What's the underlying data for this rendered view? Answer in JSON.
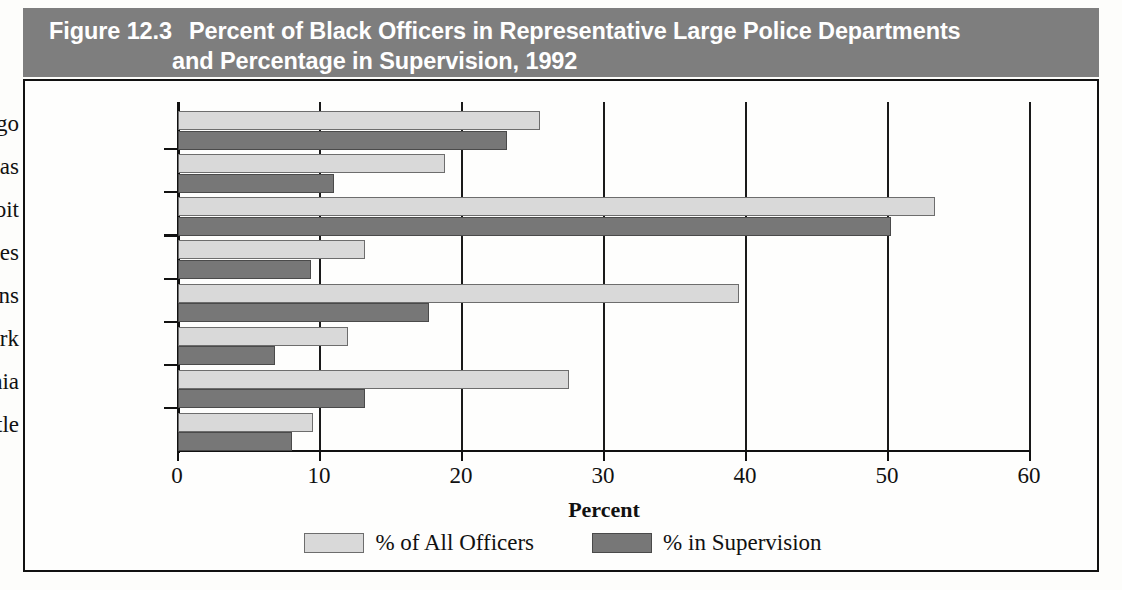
{
  "figure": {
    "number": "Figure 12.3",
    "title_line_1": "Percent of Black Officers in Representative Large Police Departments",
    "title_line_2": "and Percentage in Supervision, 1992",
    "banner_color": "#7e7e7e"
  },
  "chart_data": {
    "type": "bar",
    "orientation": "horizontal",
    "xlabel": "Percent",
    "ylabel": "",
    "xlim": [
      0,
      60
    ],
    "xticks": [
      0,
      10,
      20,
      30,
      40,
      50,
      60
    ],
    "xtick_labels": [
      "0",
      "10",
      "20",
      "30",
      "40",
      "50",
      "60"
    ],
    "grid": true,
    "legend_position": "bottom",
    "categories": [
      "Chicago",
      "Dallas",
      "Detroit",
      "Los Angeles",
      "New Orleans",
      "New York",
      "Philadelphia",
      "Seattle"
    ],
    "series": [
      {
        "name": "% of All Officers",
        "color": "#d9d9d9",
        "values": [
          25.5,
          18.8,
          53.3,
          13.2,
          39.5,
          12.0,
          27.5,
          9.5
        ]
      },
      {
        "name": "% in Supervision",
        "color": "#777777",
        "values": [
          23.2,
          11.0,
          50.2,
          9.4,
          17.7,
          6.8,
          13.2,
          8.0
        ]
      }
    ]
  }
}
